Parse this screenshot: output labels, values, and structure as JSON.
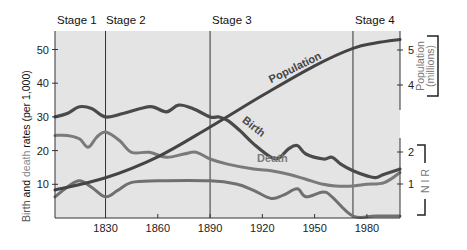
{
  "chart_data": {
    "type": "line",
    "title": "",
    "stages": [
      {
        "label": "Stage 1",
        "start": 1800,
        "end": 1830
      },
      {
        "label": "Stage 2",
        "start": 1830,
        "end": 1890
      },
      {
        "label": "Stage 3",
        "start": 1890,
        "end": 1972
      },
      {
        "label": "Stage 4",
        "start": 1972,
        "end": 2000
      }
    ],
    "xlabel": "",
    "x_ticks": [
      1830,
      1860,
      1890,
      1920,
      1950,
      1980
    ],
    "xlim": [
      1801,
      1999
    ],
    "left_axis": {
      "label_parts": [
        {
          "text": "Birth",
          "color": "#555555"
        },
        {
          "text": " and ",
          "color": "#111111"
        },
        {
          "text": "death",
          "color": "#8a8a8a"
        },
        {
          "text": " rates (per 1,000)",
          "color": "#111111"
        }
      ],
      "ticks": [
        10,
        20,
        30,
        40,
        50
      ],
      "ylim": [
        0,
        55
      ]
    },
    "right_axis_population": {
      "label": "Population",
      "sublabel": "(millions)",
      "ticks": [
        4,
        5
      ]
    },
    "right_axis_nir": {
      "label": "N I R",
      "ticks": [
        1,
        2
      ]
    },
    "series": [
      {
        "name": "Birth",
        "axis": "left",
        "color": "#4a4a4a",
        "x": [
          1801,
          1808,
          1815,
          1822,
          1830,
          1840,
          1850,
          1857,
          1865,
          1872,
          1880,
          1890,
          1895,
          1900,
          1907,
          1915,
          1925,
          1930,
          1935,
          1940,
          1945,
          1955,
          1960,
          1965,
          1972,
          1980,
          1985,
          1990,
          1999
        ],
        "values": [
          30,
          31,
          33,
          32.5,
          30,
          31,
          32.5,
          33,
          31.5,
          33.5,
          32.5,
          30,
          30,
          29,
          26,
          22,
          18,
          18,
          20.5,
          21.5,
          19,
          17.5,
          18,
          16,
          14,
          12.5,
          12,
          13,
          14.5
        ]
      },
      {
        "name": "Death",
        "axis": "left",
        "color": "#7a7a7a",
        "x": [
          1801,
          1808,
          1815,
          1820,
          1825,
          1830,
          1838,
          1845,
          1855,
          1865,
          1875,
          1882,
          1890,
          1900,
          1915,
          1925,
          1935,
          1945,
          1955,
          1962,
          1972,
          1980,
          1990,
          1999
        ],
        "values": [
          24.5,
          24.5,
          23.5,
          21,
          24,
          25.5,
          23,
          19.5,
          19.5,
          18,
          19,
          19.5,
          17.5,
          16,
          14.5,
          14,
          13,
          11.5,
          10,
          9.5,
          9.5,
          10,
          10.5,
          13.5
        ]
      },
      {
        "name": "Natural Increase",
        "axis": "right_nir",
        "color": "#707070",
        "x": [
          1801,
          1808,
          1815,
          1822,
          1830,
          1837,
          1845,
          1860,
          1890,
          1905,
          1915,
          1925,
          1932,
          1940,
          1945,
          1955,
          1960,
          1972,
          1985,
          1999
        ],
        "values": [
          0.6,
          0.9,
          1.1,
          0.9,
          0.6,
          0.8,
          1.05,
          1.1,
          1.1,
          1.0,
          0.8,
          0.55,
          0.65,
          0.85,
          0.6,
          0.75,
          0.6,
          0.0,
          0.0,
          0.0
        ]
      },
      {
        "name": "Population",
        "axis": "right_pop",
        "color": "#444444",
        "x": [
          1801,
          1830,
          1860,
          1890,
          1920,
          1950,
          1972,
          1985,
          1999
        ],
        "values": [
          1.0,
          1.35,
          1.95,
          2.8,
          3.7,
          4.55,
          5.05,
          5.2,
          5.3
        ]
      }
    ],
    "annotations": [
      {
        "text": "Population",
        "x": 1925,
        "y": 4.05,
        "angle": -26,
        "series": "Population"
      },
      {
        "text": "Birth",
        "x": 1908,
        "y": 28.6,
        "angle": 38,
        "series": "Birth"
      },
      {
        "text": "Death",
        "x": 1917,
        "y": 16.5,
        "angle": 0,
        "series": "Death"
      },
      {
        "text": "Natural Increase",
        "x": 1869,
        "y": 7.5,
        "angle": 0,
        "series": "Natural Increase"
      }
    ],
    "grid": false,
    "legend": "none (inline curve labels)",
    "background": "#e4e4e4"
  }
}
